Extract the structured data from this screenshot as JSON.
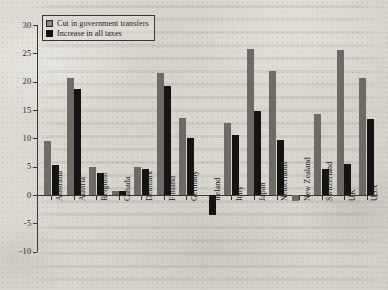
{
  "chart_data": {
    "type": "bar",
    "title": "",
    "xlabel": "",
    "ylabel": "",
    "ylim": [
      -10,
      30
    ],
    "ytick_step": 5,
    "yticks": [
      "30",
      "25",
      "20",
      "15",
      "10",
      "5",
      "0",
      "-5",
      "-10"
    ],
    "grid": false,
    "legend_position": "top-left",
    "categories": [
      "Australia",
      "Austria",
      "Belgium",
      "Canada",
      "Denmark",
      "Finland",
      "Germany",
      "Ireland",
      "Italy",
      "Japan",
      "Netherlands",
      "New Zealand",
      "Switzerland",
      "UK",
      "USA"
    ],
    "series": [
      {
        "name": "Cut in government transfers",
        "color": "#6e6b67",
        "values": [
          9.5,
          20.7,
          5.0,
          0.7,
          5.0,
          21.5,
          13.6,
          0.0,
          12.7,
          25.8,
          21.8,
          -1.0,
          14.3,
          25.6,
          20.7
        ]
      },
      {
        "name": "Increase in all taxes",
        "color": "#161412",
        "values": [
          5.3,
          18.7,
          3.8,
          0.7,
          4.6,
          19.3,
          10.0,
          -3.6,
          10.6,
          14.8,
          9.7,
          0.0,
          4.6,
          5.5,
          13.4
        ]
      }
    ]
  },
  "colors": {
    "paper": "#d8d6cf",
    "ink": "#2b2825",
    "series_gray": "#6e6b67",
    "series_black": "#161412"
  }
}
